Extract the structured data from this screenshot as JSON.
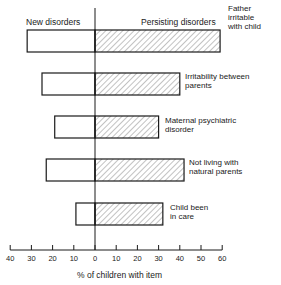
{
  "chart_data": {
    "type": "bar",
    "orientation": "horizontal-diverging",
    "title": "",
    "left_header": "New disorders",
    "right_header": "Persisting disorders",
    "xlabel": "% of children with item",
    "ylabel": "",
    "xlim": [
      -40,
      60
    ],
    "x_ticks": [
      "40",
      "30",
      "20",
      "10",
      "0",
      "10",
      "20",
      "30",
      "40",
      "50",
      "60"
    ],
    "grid": false,
    "legend": null,
    "categories": [
      "Father irritable with child",
      "Irritability between parents",
      "Maternal psychiatric disorder",
      "Not living with natural parents",
      "Child been in care"
    ],
    "series": [
      {
        "name": "New disorders",
        "fill": "open",
        "values": [
          32,
          25,
          19,
          23,
          9
        ]
      },
      {
        "name": "Persisting disorders",
        "fill": "hatched",
        "values": [
          59,
          40,
          30,
          42,
          32
        ]
      }
    ]
  },
  "labels": [
    "Father\nirritable\nwith child",
    "Irritability between\nparents",
    "Maternal psychiatric\ndisorder",
    "Not living with\nnatural parents",
    "Child been\nin care"
  ]
}
